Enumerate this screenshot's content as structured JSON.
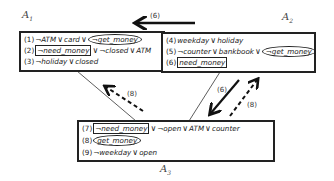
{
  "agents": {
    "a1": {
      "label": "A",
      "sub": "1"
    },
    "a2": {
      "label": "A",
      "sub": "2"
    },
    "a3": {
      "label": "A",
      "sub": "3"
    }
  },
  "box_a1": {
    "clauses": [
      {
        "num": "(1)",
        "parts": [
          "¬ATM",
          "∨",
          "card",
          "∨",
          "¬get_money"
        ],
        "oval": "¬get_money"
      },
      {
        "num": "(2)",
        "parts": [
          "¬need_money",
          "∨",
          "¬closed",
          "∨",
          "ATM"
        ],
        "rect": "¬need_money"
      },
      {
        "num": "(3)",
        "parts": [
          "¬holiday",
          "∨",
          "closed"
        ]
      }
    ]
  },
  "box_a2": {
    "clauses": [
      {
        "num": "(4)",
        "parts": [
          "weekday",
          "∨",
          "holiday"
        ]
      },
      {
        "num": "(5)",
        "parts": [
          "¬counter",
          "∨",
          "bankbook",
          "∨",
          "¬get_money"
        ],
        "oval": "¬get_money"
      },
      {
        "num": "(6)",
        "parts": [
          "need_money"
        ],
        "rect": "need_money"
      }
    ]
  },
  "box_a3": {
    "clauses": [
      {
        "num": "(7)",
        "parts": [
          "¬need_money",
          "∨",
          "¬open",
          "∨",
          "ATM",
          "∨",
          "counter"
        ],
        "rect": "¬need_money"
      },
      {
        "num": "(8)",
        "parts": [
          "get_money"
        ],
        "oval": "get_money"
      },
      {
        "num": "(9)",
        "parts": [
          "¬weekday",
          "∨",
          "open"
        ]
      }
    ]
  },
  "arrows": {
    "a2_to_a1": {
      "label": "(6)",
      "style": "solid-bold"
    },
    "a3_to_a1": {
      "label": "(8)",
      "style": "dashed"
    },
    "a2_to_a3": {
      "label": "(6)",
      "style": "solid-bold"
    },
    "a3_to_a2": {
      "label": "(8)",
      "style": "dashed"
    }
  }
}
